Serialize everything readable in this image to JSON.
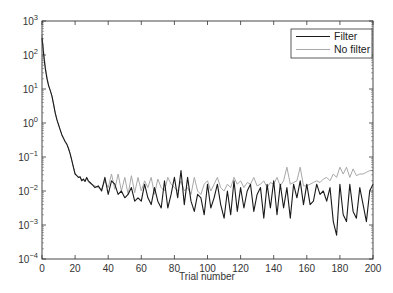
{
  "chart_data": {
    "type": "line",
    "title": "",
    "xlabel": "Trial number",
    "ylabel": "",
    "xlim": [
      0,
      200
    ],
    "ylim": [
      0.0001,
      1000
    ],
    "yscale": "log",
    "x_ticks": [
      0,
      20,
      40,
      60,
      80,
      100,
      120,
      140,
      160,
      180,
      200
    ],
    "x_tick_labels": [
      "0",
      "20",
      "40",
      "60",
      "80",
      "100",
      "120",
      "140",
      "160",
      "180",
      "200"
    ],
    "y_ticks_log10": [
      -4,
      -3,
      -2,
      -1,
      0,
      1,
      2,
      3
    ],
    "y_tick_labels": [
      {
        "base": "10",
        "exp": "−4"
      },
      {
        "base": "10",
        "exp": "−3"
      },
      {
        "base": "10",
        "exp": "−2"
      },
      {
        "base": "10",
        "exp": "−1"
      },
      {
        "base": "10",
        "exp": "0"
      },
      {
        "base": "10",
        "exp": "1"
      },
      {
        "base": "10",
        "exp": "2"
      },
      {
        "base": "10",
        "exp": "3"
      }
    ],
    "grid": false,
    "legend_position": "upper right",
    "series": [
      {
        "name": "Filter",
        "color": "#1a1a1a",
        "width": 1.1,
        "x": [
          0,
          1,
          2,
          3,
          4,
          5,
          6,
          7,
          8,
          9,
          10,
          11,
          12,
          13,
          14,
          15,
          16,
          17,
          18,
          19,
          20,
          21,
          22,
          23,
          24,
          25,
          26,
          27,
          28,
          29,
          30,
          32,
          34,
          36,
          38,
          40,
          42,
          44,
          46,
          48,
          50,
          52,
          54,
          56,
          58,
          60,
          62,
          64,
          66,
          68,
          70,
          72,
          74,
          76,
          78,
          80,
          82,
          84,
          86,
          88,
          90,
          92,
          94,
          96,
          98,
          100,
          102,
          104,
          106,
          108,
          110,
          112,
          114,
          116,
          118,
          120,
          122,
          124,
          126,
          128,
          130,
          132,
          134,
          136,
          138,
          140,
          142,
          144,
          146,
          148,
          150,
          152,
          154,
          156,
          158,
          160,
          162,
          164,
          166,
          168,
          170,
          172,
          174,
          176,
          178,
          180,
          182,
          184,
          186,
          188,
          190,
          192,
          194,
          196,
          198,
          200
        ],
        "log10_values": [
          2.5,
          2.0,
          1.6,
          1.3,
          1.1,
          0.95,
          0.8,
          0.55,
          0.3,
          0.1,
          -0.05,
          -0.2,
          -0.35,
          -0.45,
          -0.55,
          -0.62,
          -0.75,
          -0.9,
          -1.1,
          -1.3,
          -1.5,
          -1.55,
          -1.6,
          -1.58,
          -1.7,
          -1.65,
          -1.72,
          -1.6,
          -1.7,
          -1.75,
          -1.8,
          -1.9,
          -1.85,
          -2.0,
          -1.6,
          -2.1,
          -1.7,
          -1.8,
          -2.1,
          -2.0,
          -2.2,
          -2.1,
          -1.9,
          -2.3,
          -2.2,
          -2.3,
          -1.8,
          -2.2,
          -2.4,
          -1.9,
          -2.3,
          -2.5,
          -1.7,
          -2.5,
          -2.1,
          -1.6,
          -2.2,
          -1.4,
          -2.4,
          -1.6,
          -2.3,
          -2.6,
          -2.1,
          -2.2,
          -2.7,
          -1.8,
          -2.5,
          -2.2,
          -1.8,
          -2.4,
          -2.8,
          -2.0,
          -2.7,
          -1.7,
          -2.6,
          -1.9,
          -2.5,
          -2.0,
          -1.8,
          -2.6,
          -2.1,
          -1.9,
          -2.8,
          -1.8,
          -2.5,
          -1.7,
          -2.7,
          -1.8,
          -2.5,
          -1.9,
          -2.8,
          -1.8,
          -2.2,
          -1.7,
          -2.4,
          -1.8,
          -2.4,
          -2.3,
          -1.8,
          -2.1,
          -2.0,
          -2.3,
          -1.9,
          -2.9,
          -3.3,
          -1.8,
          -2.7,
          -2.9,
          -1.8,
          -2.6,
          -2.8,
          -1.9,
          -2.4,
          -2.9,
          -2.0,
          -1.8,
          -2.8,
          -1.9,
          -2.4,
          -2.6
        ],
        "note": "values are log10(y); approximate readings from plot"
      },
      {
        "name": "No filter",
        "color": "#a8a8a8",
        "width": 1.0,
        "x": [
          0,
          1,
          2,
          3,
          4,
          5,
          6,
          7,
          8,
          9,
          10,
          11,
          12,
          13,
          14,
          15,
          16,
          17,
          18,
          19,
          20,
          21,
          22,
          23,
          24,
          25,
          26,
          27,
          28,
          29,
          30,
          32,
          34,
          36,
          38,
          40,
          42,
          44,
          46,
          48,
          50,
          52,
          54,
          56,
          58,
          60,
          62,
          64,
          66,
          68,
          70,
          72,
          74,
          76,
          78,
          80,
          82,
          84,
          86,
          88,
          90,
          92,
          94,
          96,
          98,
          100,
          102,
          104,
          106,
          108,
          110,
          112,
          114,
          116,
          118,
          120,
          122,
          124,
          126,
          128,
          130,
          132,
          134,
          136,
          138,
          140,
          142,
          144,
          146,
          148,
          150,
          152,
          154,
          156,
          158,
          160,
          162,
          164,
          166,
          168,
          170,
          172,
          174,
          176,
          178,
          180,
          182,
          184,
          186,
          188,
          190,
          192,
          194,
          196,
          198,
          200
        ],
        "log10_values": [
          2.6,
          2.1,
          1.65,
          1.35,
          1.1,
          0.95,
          0.8,
          0.55,
          0.3,
          0.1,
          -0.05,
          -0.2,
          -0.35,
          -0.45,
          -0.55,
          -0.62,
          -0.75,
          -0.9,
          -1.1,
          -1.3,
          -1.5,
          -1.55,
          -1.6,
          -1.6,
          -1.68,
          -1.65,
          -1.7,
          -1.62,
          -1.72,
          -1.78,
          -1.8,
          -1.85,
          -1.9,
          -1.95,
          -1.7,
          -1.9,
          -1.5,
          -1.95,
          -1.5,
          -2.0,
          -1.6,
          -2.1,
          -1.55,
          -2.05,
          -1.6,
          -2.0,
          -1.7,
          -1.9,
          -1.6,
          -2.1,
          -1.65,
          -1.9,
          -2.0,
          -1.6,
          -1.8,
          -1.9,
          -2.0,
          -1.7,
          -2.0,
          -1.9,
          -2.1,
          -1.6,
          -2.0,
          -2.1,
          -1.8,
          -1.7,
          -2.0,
          -1.8,
          -1.6,
          -1.9,
          -2.0,
          -1.8,
          -1.9,
          -1.6,
          -1.8,
          -1.7,
          -1.9,
          -1.75,
          -1.8,
          -1.6,
          -1.85,
          -1.8,
          -1.7,
          -1.9,
          -1.75,
          -1.8,
          -1.6,
          -1.85,
          -1.7,
          -1.3,
          -1.8,
          -1.75,
          -1.7,
          -1.3,
          -1.85,
          -1.85,
          -1.8,
          -1.75,
          -1.7,
          -1.75,
          -1.65,
          -1.6,
          -1.7,
          -1.5,
          -1.6,
          -1.3,
          -1.5,
          -1.3,
          -1.6,
          -1.35,
          -1.55,
          -1.5,
          -1.5,
          -1.45,
          -1.4,
          -1.4,
          -1.3,
          -0.85,
          -1.25,
          -1.35
        ],
        "note": "values are log10(y); approximate readings from plot"
      }
    ]
  },
  "legend": {
    "items": [
      {
        "label": "Filter",
        "color": "#1a1a1a"
      },
      {
        "label": "No filter",
        "color": "#a8a8a8"
      }
    ]
  },
  "axes": {
    "xlabel": "Trial number"
  }
}
